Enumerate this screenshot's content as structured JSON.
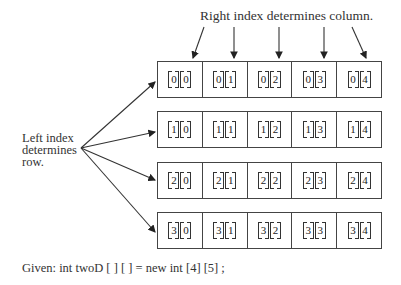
{
  "top_label": "Right index determines column.",
  "left_label": [
    "Left index",
    "determines",
    "row."
  ],
  "given": "Given: int twoD [ ] [ ] = new int [4] [5] ;",
  "rows": [
    {
      "cells": [
        [
          "0",
          "0"
        ],
        [
          "0",
          "1"
        ],
        [
          "0",
          "2"
        ],
        [
          "0",
          "3"
        ],
        [
          "0",
          "4"
        ]
      ]
    },
    {
      "cells": [
        [
          "1",
          "0"
        ],
        [
          "1",
          "1"
        ],
        [
          "1",
          "2"
        ],
        [
          "1",
          "3"
        ],
        [
          "1",
          "4"
        ]
      ]
    },
    {
      "cells": [
        [
          "2",
          "0"
        ],
        [
          "2",
          "1"
        ],
        [
          "2",
          "2"
        ],
        [
          "2",
          "3"
        ],
        [
          "2",
          "4"
        ]
      ]
    },
    {
      "cells": [
        [
          "3",
          "0"
        ],
        [
          "3",
          "1"
        ],
        [
          "3",
          "2"
        ],
        [
          "3",
          "3"
        ],
        [
          "3",
          "4"
        ]
      ]
    }
  ],
  "colors": {
    "line": "#333333",
    "text": "#222222",
    "background": "#ffffff"
  }
}
